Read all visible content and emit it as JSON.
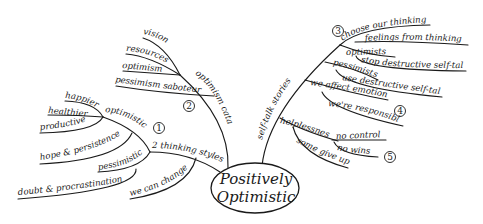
{
  "title": "Positively Optimistic",
  "center": {
    "line1": "Positively",
    "line2": "Optimistic"
  },
  "branches": {
    "optimism_catalyst": {
      "label": "optimism catalyst",
      "number": "2",
      "children": [
        "vision",
        "resources",
        "optimism",
        "pessimism saboteur"
      ]
    },
    "thinking_styles": {
      "label": "2 thinking styles",
      "number": "1",
      "optimistic": {
        "label": "optimistic",
        "children": [
          "happier",
          "healthier",
          "productive",
          "hope & persistence"
        ]
      },
      "pessimistic": {
        "label": "pessimistic",
        "children": [
          "doubt & procrastination"
        ]
      },
      "we_can_change": "we can change"
    },
    "self_talk": {
      "label": "self-talk stories",
      "choose": {
        "number": "3",
        "label": "choose our thinking",
        "child": "feelings from thinking"
      },
      "optimists": {
        "label": "optimists",
        "child": "stop destructive self-talk"
      },
      "pessimists": {
        "label": "pessimists",
        "child": "use destructive self-talk"
      },
      "emotions": {
        "label": "we affect emotions",
        "number": "4",
        "child": "we're responsible"
      },
      "helplessness": {
        "label": "helplessness",
        "number": "5",
        "children": [
          "no control",
          "no wins",
          "some give up"
        ]
      }
    }
  }
}
